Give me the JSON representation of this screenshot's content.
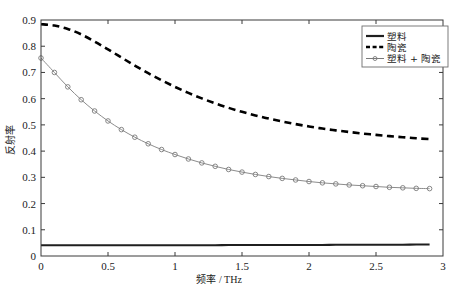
{
  "chart_data": {
    "type": "line",
    "title": "",
    "xlabel_cn": "频率",
    "xlabel_unit": "/ THz",
    "xlabel": "频率 / THz",
    "ylabel": "反射率",
    "xlim": [
      0,
      3
    ],
    "ylim": [
      0,
      0.9
    ],
    "xticks": [
      0,
      0.5,
      1,
      1.5,
      2,
      2.5,
      3
    ],
    "xticklabels": [
      "0",
      "0.5",
      "1",
      "1.5",
      "2",
      "2.5",
      "3"
    ],
    "yticks": [
      0,
      0.1,
      0.2,
      0.3,
      0.4,
      0.5,
      0.6,
      0.7,
      0.8,
      0.9
    ],
    "yticklabels": [
      "0",
      "0.1",
      "0.2",
      "0.3",
      "0.4",
      "0.5",
      "0.6",
      "0.7",
      "0.8",
      "0.9"
    ],
    "grid": false,
    "legend_position": "upper right",
    "x": [
      0,
      0.1,
      0.2,
      0.3,
      0.4,
      0.5,
      0.6,
      0.7,
      0.8,
      0.9,
      1.0,
      1.1,
      1.2,
      1.3,
      1.4,
      1.5,
      1.6,
      1.7,
      1.8,
      1.9,
      2.0,
      2.1,
      2.2,
      2.3,
      2.4,
      2.5,
      2.6,
      2.7,
      2.8,
      2.9
    ],
    "series": [
      {
        "name": "塑料",
        "style": "solid",
        "color": "#1f1f1f",
        "marker": "none",
        "values": [
          0.041,
          0.041,
          0.041,
          0.041,
          0.041,
          0.041,
          0.041,
          0.041,
          0.041,
          0.041,
          0.041,
          0.041,
          0.041,
          0.041,
          0.042,
          0.042,
          0.042,
          0.042,
          0.042,
          0.042,
          0.042,
          0.042,
          0.043,
          0.043,
          0.043,
          0.043,
          0.043,
          0.043,
          0.044,
          0.044
        ]
      },
      {
        "name": "陶瓷",
        "style": "dashed",
        "color": "#000000",
        "marker": "none",
        "values": [
          0.884,
          0.879,
          0.866,
          0.845,
          0.818,
          0.788,
          0.757,
          0.726,
          0.697,
          0.67,
          0.645,
          0.622,
          0.601,
          0.582,
          0.565,
          0.55,
          0.536,
          0.524,
          0.513,
          0.503,
          0.494,
          0.486,
          0.479,
          0.473,
          0.467,
          0.462,
          0.457,
          0.453,
          0.449,
          0.446
        ]
      },
      {
        "name": "塑料 + 陶瓷",
        "style": "solid-marker",
        "color": "#7a7a7a",
        "marker": "circle",
        "values": [
          0.755,
          0.7,
          0.645,
          0.596,
          0.553,
          0.515,
          0.482,
          0.453,
          0.428,
          0.406,
          0.387,
          0.37,
          0.355,
          0.342,
          0.33,
          0.32,
          0.311,
          0.303,
          0.296,
          0.29,
          0.284,
          0.279,
          0.275,
          0.271,
          0.268,
          0.265,
          0.262,
          0.26,
          0.258,
          0.257
        ]
      }
    ],
    "legend_entries": [
      "塑料",
      "陶瓷",
      "塑料 + 陶瓷"
    ]
  }
}
